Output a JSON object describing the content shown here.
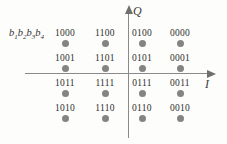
{
  "figure": {
    "bit_order_label": "b1b2b3b4",
    "bit_order_parts": [
      "b",
      "1",
      "b",
      "2",
      "b",
      "3",
      "b",
      "4"
    ],
    "background_color": "#fdfdfb",
    "dot_color": "#848484",
    "axis_color": "#8a8a8a",
    "label_color": "#2e2e2e"
  },
  "axes": {
    "q": {
      "label": "Q",
      "name": "quadrature-axis"
    },
    "i": {
      "label": "I",
      "name": "in-phase-axis"
    }
  },
  "chart_data": {
    "type": "scatter",
    "title": "",
    "xlabel": "I",
    "ylabel": "Q",
    "xlim": [
      -3,
      3
    ],
    "ylim": [
      -3,
      3
    ],
    "grid": false,
    "legend": false,
    "annotations": [
      "b1b2b3b4"
    ],
    "modulation": "16-QAM",
    "columns_x": [
      -3,
      -1,
      1,
      3
    ],
    "rows_y": [
      3,
      1,
      -1,
      -3
    ],
    "points": [
      {
        "label": "1000",
        "x": -3,
        "y": 3,
        "px": 65,
        "py": 43
      },
      {
        "label": "1100",
        "x": -1,
        "y": 3,
        "px": 105,
        "py": 43
      },
      {
        "label": "0100",
        "x": 1,
        "y": 3,
        "px": 142,
        "py": 43
      },
      {
        "label": "0000",
        "x": 3,
        "y": 3,
        "px": 180,
        "py": 43
      },
      {
        "label": "1001",
        "x": -3,
        "y": 1,
        "px": 65,
        "py": 68
      },
      {
        "label": "1101",
        "x": -1,
        "y": 1,
        "px": 105,
        "py": 68
      },
      {
        "label": "0101",
        "x": 1,
        "y": 1,
        "px": 142,
        "py": 68
      },
      {
        "label": "0001",
        "x": 3,
        "y": 1,
        "px": 180,
        "py": 68
      },
      {
        "label": "1011",
        "x": -3,
        "y": -1,
        "px": 65,
        "py": 93
      },
      {
        "label": "1111",
        "x": -1,
        "y": -1,
        "px": 105,
        "py": 93
      },
      {
        "label": "0111",
        "x": 1,
        "y": -1,
        "px": 142,
        "py": 93
      },
      {
        "label": "0011",
        "x": 3,
        "y": -1,
        "px": 180,
        "py": 93
      },
      {
        "label": "1010",
        "x": -3,
        "y": -3,
        "px": 65,
        "py": 118
      },
      {
        "label": "1110",
        "x": -1,
        "y": -3,
        "px": 105,
        "py": 118
      },
      {
        "label": "0110",
        "x": 1,
        "y": -3,
        "px": 142,
        "py": 118
      },
      {
        "label": "0010",
        "x": 3,
        "y": -3,
        "px": 180,
        "py": 118
      }
    ]
  }
}
